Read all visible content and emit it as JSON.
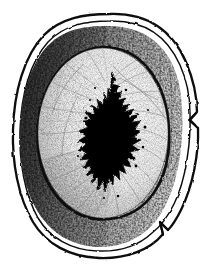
{
  "figure": {
    "title": "Cross-section engraving",
    "medium": "line-and-stipple engraving",
    "canvas": {
      "width": 216,
      "height": 272,
      "background_color": "#ffffff"
    },
    "colors": {
      "ink": "#000000",
      "background": "#ffffff",
      "outer_band_shade": "#7e7e7e",
      "inner_body_shade": "#d8d8d8",
      "cavity_fill": "#000000",
      "striation": "#9a9a9a"
    },
    "parts": [
      {
        "id": "outer-contour",
        "label": "Outer contour",
        "note": "Double line forming a rounded-square oval around the whole specimen",
        "stroke_width": 2.1
      },
      {
        "id": "outer-contour-inner-line",
        "label": "Inner companion line",
        "note": "Second thinner line running just inside the outer contour",
        "stroke_width": 1.5
      },
      {
        "id": "notch-upper-right",
        "label": "Upper right notch",
        "note": "V-shaped kink in the outer contour on the right side",
        "position": {
          "x": 189,
          "y": 116
        }
      },
      {
        "id": "notch-lower-right",
        "label": "Lower right notch",
        "note": "Arrow-like kink in the outer contour at the lower right",
        "position": {
          "x": 170,
          "y": 231
        }
      },
      {
        "id": "cortical-band",
        "label": "Shaded cortical band",
        "note": "Dense cross-hatched band between the outer contour and the inner oval, darkest on the left",
        "stroke_width": 2.6
      },
      {
        "id": "inner-body",
        "label": "Inner body",
        "note": "Lighter stippled oval region occupying the interior",
        "center": {
          "x": 103,
          "y": 133
        },
        "radius_x": 66,
        "radius_y": 86
      },
      {
        "id": "striations",
        "label": "Radiating striations",
        "note": "Fine lines radiating outward from the central cavity toward the inner oval margin",
        "count": 40
      },
      {
        "id": "central-cavity",
        "label": "Central cavity",
        "note": "Solid black vertically elongated jagged shape at the centre",
        "bounds": {
          "x": 88,
          "y": 72,
          "width": 53,
          "height": 124
        }
      }
    ]
  }
}
